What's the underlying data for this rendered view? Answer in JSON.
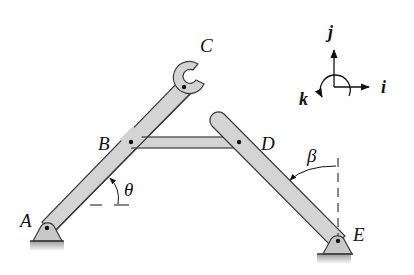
{
  "figure": {
    "points": {
      "A": "A",
      "B": "B",
      "C": "C",
      "D": "D",
      "E": "E"
    },
    "angles": {
      "theta": "θ",
      "beta": "β"
    },
    "axes": {
      "i": "i",
      "j": "j",
      "k": "k"
    },
    "colors": {
      "member_fill": "#d4d4d4",
      "member_stroke": "#3a3a3a",
      "support_fill": "#c8c8c8",
      "ground": "#bdbdbd",
      "ink": "#111111"
    }
  }
}
